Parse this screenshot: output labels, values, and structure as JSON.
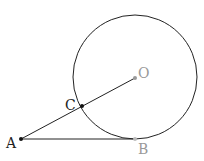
{
  "diagram": {
    "type": "geometry",
    "points": {
      "A": {
        "label": "A"
      },
      "B": {
        "label": "B"
      },
      "C": {
        "label": "C"
      },
      "O": {
        "label": "O"
      }
    },
    "segments": [
      [
        "A",
        "B"
      ],
      [
        "A",
        "O"
      ]
    ],
    "circle": {
      "center": "O",
      "through": "B"
    },
    "colors": {
      "stroke": "#222222",
      "dark_point": "#111111",
      "light_point": "#999999",
      "light_label": "#999999",
      "dark_label": "#222222"
    }
  }
}
